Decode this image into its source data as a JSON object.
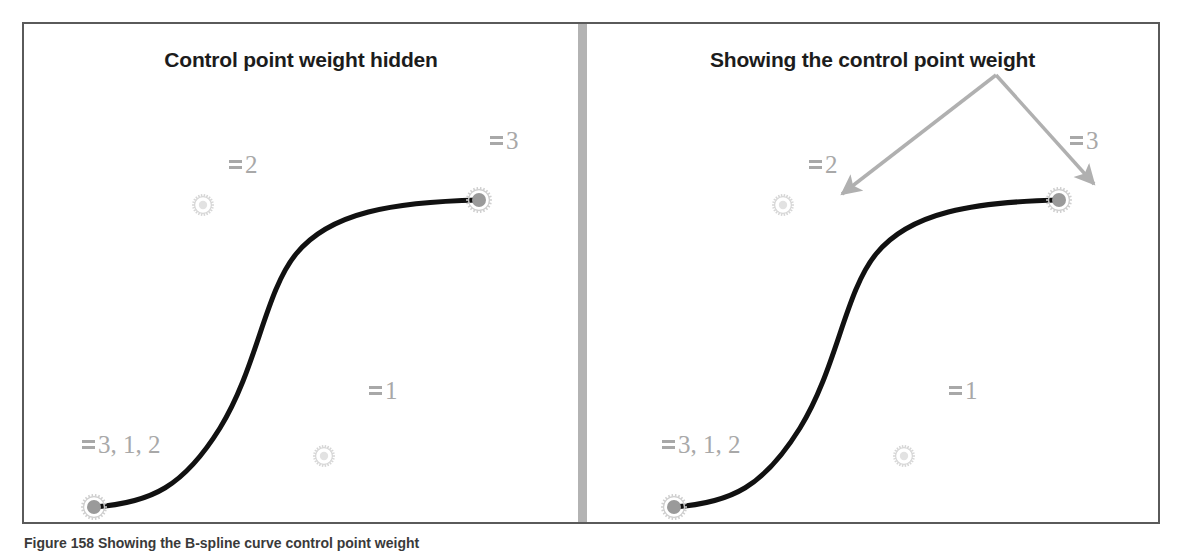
{
  "figure": {
    "caption": "Figure 158 Showing the B-spline curve control point weight",
    "border_color": "#5a5a5a",
    "divider_color": "#b3b3b3",
    "background": "#ffffff"
  },
  "panels": [
    {
      "id": "left",
      "title": "Control point weight hidden",
      "curve_color": "#111111",
      "marker_color": "#9a9a9a",
      "label_color": "#a8a8a8",
      "weight_labels": [
        {
          "glyph": "weight-bars-icon",
          "text": "2",
          "x": 205,
          "y": 128
        },
        {
          "glyph": "weight-bars-icon",
          "text": "3",
          "x": 466,
          "y": 104
        },
        {
          "glyph": "weight-bars-icon",
          "text": "1",
          "x": 345,
          "y": 354
        },
        {
          "glyph": "weight-bars-icon",
          "text": "3, 1, 2",
          "x": 58,
          "y": 408
        }
      ],
      "control_points": [
        {
          "name": "control-point-marker",
          "x": 179,
          "y": 181,
          "type": "open"
        },
        {
          "name": "control-point-marker",
          "x": 300,
          "y": 432,
          "type": "open"
        }
      ],
      "endpoints": [
        {
          "name": "curve-endpoint-marker",
          "x": 70,
          "y": 483,
          "type": "filled"
        },
        {
          "name": "curve-endpoint-marker",
          "x": 455,
          "y": 176,
          "type": "filled"
        }
      ],
      "curve": "M70,483 C128,479 160,462 196,404 C233,344 241,268 272,230 C306,188 370,178 455,176"
    },
    {
      "id": "right",
      "title": "Showing the control point weight",
      "curve_color": "#111111",
      "marker_color": "#9a9a9a",
      "label_color": "#a8a8a8",
      "arrow_color": "#b0b0b0",
      "weight_labels": [
        {
          "glyph": "weight-bars-icon",
          "text": "2",
          "x": 222,
          "y": 128
        },
        {
          "glyph": "weight-bars-icon",
          "text": "3",
          "x": 483,
          "y": 104
        },
        {
          "glyph": "weight-bars-icon",
          "text": "1",
          "x": 362,
          "y": 354
        },
        {
          "glyph": "weight-bars-icon",
          "text": "3, 1, 2",
          "x": 75,
          "y": 408
        }
      ],
      "control_points": [
        {
          "name": "control-point-marker",
          "x": 196,
          "y": 181,
          "type": "open"
        },
        {
          "name": "control-point-marker",
          "x": 317,
          "y": 432,
          "type": "open"
        }
      ],
      "endpoints": [
        {
          "name": "curve-endpoint-marker",
          "x": 87,
          "y": 483,
          "type": "filled"
        },
        {
          "name": "curve-endpoint-marker",
          "x": 472,
          "y": 176,
          "type": "filled"
        }
      ],
      "curve": "M87,483 C145,479 177,462 213,404 C250,344 258,268 289,230 C323,188 387,178 472,176",
      "annotation_arrows": [
        {
          "name": "annotation-arrow-left",
          "x1": 409,
          "y1": 51,
          "x2": 255,
          "y2": 170
        },
        {
          "name": "annotation-arrow-right",
          "x1": 409,
          "y1": 51,
          "x2": 507,
          "y2": 160
        }
      ]
    }
  ]
}
